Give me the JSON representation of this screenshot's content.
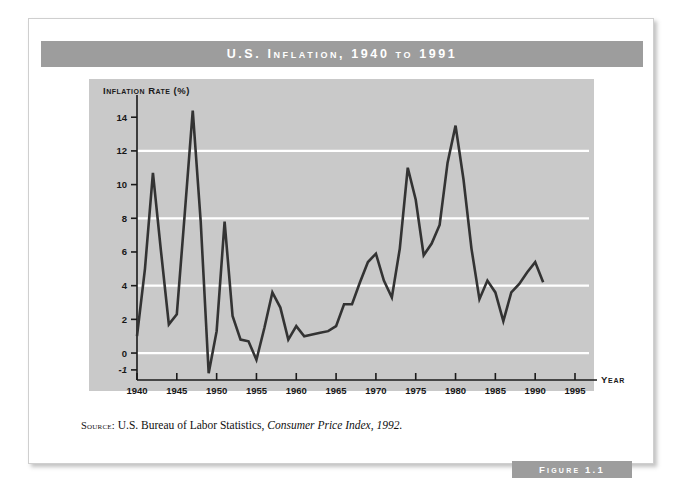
{
  "figure": {
    "title": "U.S. Inflation, 1940 to 1991",
    "banner_label": "Figure 1.1",
    "source_prefix": "Source:",
    "source_text": "U.S. Bureau of Labor Statistics,",
    "source_italic": "Consumer Price Index, 1992."
  },
  "colors": {
    "plot_background": "#c9c9c9",
    "band": "#9d9d9d",
    "gridline": "#ffffff",
    "line": "#333333",
    "axis": "#1a1a1a",
    "card": "#ffffff"
  },
  "chart_data": {
    "type": "line",
    "title": "U.S. Inflation, 1940 to 1991",
    "xlabel": "Year",
    "ylabel": "Inflation Rate (%)",
    "xlim": [
      1940,
      1995
    ],
    "ylim": [
      -1.6,
      15.2
    ],
    "xticks": [
      1940,
      1945,
      1950,
      1955,
      1960,
      1965,
      1970,
      1975,
      1980,
      1985,
      1990,
      1995
    ],
    "xtick_labels": [
      "1940",
      "1945",
      "1950",
      "1955",
      "1960",
      "1965",
      "1970",
      "1975",
      "1980",
      "1985",
      "1990",
      "1995"
    ],
    "yticks": [
      -1,
      0,
      2,
      4,
      6,
      8,
      10,
      12,
      14
    ],
    "ytick_labels": [
      "-1",
      "0",
      "2",
      "4",
      "6",
      "8",
      "10",
      "12",
      "14"
    ],
    "gridlines_y": [
      0,
      4,
      8,
      12
    ],
    "grid": true,
    "legend": "none",
    "series": [
      {
        "name": "Inflation Rate (%)",
        "x": [
          1940,
          1941,
          1942,
          1943,
          1944,
          1945,
          1946,
          1947,
          1948,
          1949,
          1950,
          1951,
          1952,
          1953,
          1954,
          1955,
          1956,
          1957,
          1958,
          1959,
          1960,
          1961,
          1962,
          1963,
          1964,
          1965,
          1966,
          1967,
          1968,
          1969,
          1970,
          1971,
          1972,
          1973,
          1974,
          1975,
          1976,
          1977,
          1978,
          1979,
          1980,
          1981,
          1982,
          1983,
          1984,
          1985,
          1986,
          1987,
          1988,
          1989,
          1990,
          1991
        ],
        "values": [
          1.0,
          5.0,
          10.7,
          6.1,
          1.7,
          2.3,
          8.3,
          14.4,
          7.8,
          -1.2,
          1.3,
          7.8,
          2.2,
          0.8,
          0.7,
          -0.4,
          1.5,
          3.6,
          2.7,
          0.8,
          1.6,
          1.0,
          1.1,
          1.2,
          1.3,
          1.6,
          2.9,
          2.9,
          4.2,
          5.4,
          5.9,
          4.3,
          3.3,
          6.2,
          11.0,
          9.1,
          5.8,
          6.5,
          7.6,
          11.3,
          13.5,
          10.3,
          6.2,
          3.2,
          4.3,
          3.6,
          1.9,
          3.6,
          4.1,
          4.8,
          5.4,
          4.2
        ]
      }
    ]
  }
}
